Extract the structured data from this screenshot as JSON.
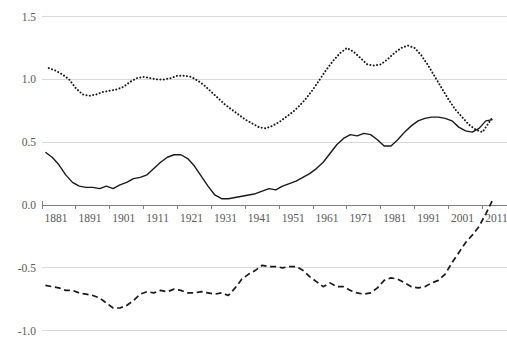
{
  "chart_data": {
    "type": "line",
    "title": "",
    "subtitle": "",
    "xlabel": "",
    "ylabel": "",
    "xlim": [
      1881,
      2015
    ],
    "ylim": [
      -1.0,
      1.5
    ],
    "grid": true,
    "legend": "none",
    "x_ticks": [
      "1881",
      "1891",
      "1901",
      "1911",
      "1921",
      "1931",
      "1941",
      "1951",
      "1961",
      "1971",
      "1981",
      "1991",
      "2001",
      "2011"
    ],
    "x_tick_values": [
      1881,
      1891,
      1901,
      1911,
      1921,
      1931,
      1941,
      1951,
      1961,
      1971,
      1981,
      1991,
      2001,
      2011
    ],
    "y_ticks": [
      "1.5",
      "1.0",
      "0.5",
      "0.0",
      "-0.5",
      "-1.0"
    ],
    "y_tick_values": [
      1.5,
      1.0,
      0.5,
      0.0,
      -0.5,
      -1.0
    ],
    "axis_line_at": 0.0,
    "colors": {
      "line": "#1a1a1a",
      "grid": "#d9d9d9",
      "axis": "#7f7f7f",
      "tick_text": "#595959",
      "background": "#ffffff"
    },
    "series": [
      {
        "name": "upper-dotted-series",
        "style": "dotted",
        "x": [
          1883,
          1885,
          1887,
          1889,
          1891,
          1893,
          1895,
          1897,
          1899,
          1901,
          1903,
          1905,
          1907,
          1909,
          1911,
          1913,
          1915,
          1917,
          1919,
          1921,
          1923,
          1925,
          1927,
          1929,
          1931,
          1933,
          1935,
          1937,
          1939,
          1941,
          1943,
          1945,
          1947,
          1949,
          1951,
          1953,
          1955,
          1957,
          1959,
          1961,
          1963,
          1965,
          1967,
          1969,
          1971,
          1973,
          1975,
          1977,
          1979,
          1981,
          1983,
          1985,
          1987,
          1989,
          1991,
          1993,
          1995,
          1997,
          1999,
          2001,
          2003,
          2005,
          2007,
          2009,
          2011,
          2013,
          2014
        ],
        "y": [
          1.09,
          1.07,
          1.04,
          1.0,
          0.93,
          0.88,
          0.87,
          0.88,
          0.9,
          0.91,
          0.92,
          0.94,
          0.98,
          1.01,
          1.02,
          1.01,
          1.0,
          1.0,
          1.01,
          1.03,
          1.03,
          1.02,
          0.99,
          0.95,
          0.9,
          0.85,
          0.8,
          0.76,
          0.72,
          0.68,
          0.65,
          0.62,
          0.61,
          0.63,
          0.66,
          0.7,
          0.74,
          0.79,
          0.85,
          0.92,
          1.0,
          1.08,
          1.15,
          1.21,
          1.25,
          1.22,
          1.17,
          1.12,
          1.11,
          1.12,
          1.16,
          1.21,
          1.25,
          1.27,
          1.25,
          1.19,
          1.11,
          1.02,
          0.93,
          0.84,
          0.76,
          0.7,
          0.64,
          0.6,
          0.58,
          0.66,
          0.7
        ]
      },
      {
        "name": "middle-solid-series",
        "style": "solid",
        "x": [
          1882,
          1884,
          1886,
          1888,
          1890,
          1892,
          1894,
          1896,
          1898,
          1900,
          1902,
          1904,
          1906,
          1908,
          1910,
          1912,
          1914,
          1916,
          1918,
          1920,
          1922,
          1924,
          1926,
          1928,
          1930,
          1932,
          1934,
          1936,
          1938,
          1940,
          1942,
          1944,
          1946,
          1948,
          1950,
          1952,
          1954,
          1956,
          1958,
          1960,
          1962,
          1964,
          1966,
          1968,
          1970,
          1972,
          1974,
          1976,
          1978,
          1980,
          1982,
          1984,
          1986,
          1988,
          1990,
          1992,
          1994,
          1996,
          1998,
          2000,
          2002,
          2004,
          2006,
          2008,
          2010,
          2012,
          2014
        ],
        "y": [
          0.42,
          0.38,
          0.32,
          0.24,
          0.18,
          0.15,
          0.14,
          0.14,
          0.13,
          0.15,
          0.13,
          0.16,
          0.18,
          0.21,
          0.22,
          0.24,
          0.29,
          0.34,
          0.38,
          0.4,
          0.4,
          0.37,
          0.31,
          0.23,
          0.15,
          0.08,
          0.05,
          0.05,
          0.06,
          0.07,
          0.08,
          0.09,
          0.11,
          0.13,
          0.12,
          0.15,
          0.17,
          0.19,
          0.22,
          0.25,
          0.29,
          0.34,
          0.41,
          0.48,
          0.53,
          0.56,
          0.55,
          0.57,
          0.56,
          0.52,
          0.47,
          0.47,
          0.52,
          0.58,
          0.63,
          0.67,
          0.69,
          0.7,
          0.7,
          0.69,
          0.67,
          0.62,
          0.59,
          0.58,
          0.61,
          0.67,
          0.68
        ]
      },
      {
        "name": "lower-dashed-series",
        "style": "dashed",
        "x": [
          1882,
          1884,
          1886,
          1888,
          1890,
          1892,
          1894,
          1896,
          1898,
          1900,
          1902,
          1904,
          1906,
          1908,
          1910,
          1912,
          1914,
          1916,
          1918,
          1920,
          1922,
          1924,
          1926,
          1928,
          1930,
          1932,
          1934,
          1936,
          1938,
          1940,
          1942,
          1944,
          1946,
          1948,
          1950,
          1952,
          1954,
          1956,
          1958,
          1960,
          1962,
          1964,
          1966,
          1968,
          1970,
          1972,
          1974,
          1976,
          1978,
          1980,
          1982,
          1984,
          1986,
          1988,
          1990,
          1992,
          1994,
          1996,
          1998,
          2000,
          2002,
          2004,
          2006,
          2008,
          2010,
          2012,
          2014
        ],
        "y": [
          -0.64,
          -0.65,
          -0.66,
          -0.68,
          -0.68,
          -0.7,
          -0.71,
          -0.72,
          -0.74,
          -0.78,
          -0.82,
          -0.82,
          -0.8,
          -0.76,
          -0.71,
          -0.69,
          -0.7,
          -0.68,
          -0.69,
          -0.67,
          -0.68,
          -0.7,
          -0.7,
          -0.69,
          -0.7,
          -0.71,
          -0.7,
          -0.72,
          -0.66,
          -0.59,
          -0.55,
          -0.52,
          -0.48,
          -0.49,
          -0.49,
          -0.5,
          -0.49,
          -0.49,
          -0.52,
          -0.57,
          -0.61,
          -0.65,
          -0.62,
          -0.65,
          -0.65,
          -0.68,
          -0.7,
          -0.71,
          -0.7,
          -0.66,
          -0.6,
          -0.58,
          -0.59,
          -0.62,
          -0.65,
          -0.66,
          -0.65,
          -0.62,
          -0.6,
          -0.55,
          -0.46,
          -0.38,
          -0.3,
          -0.24,
          -0.17,
          -0.07,
          0.04
        ]
      }
    ]
  }
}
